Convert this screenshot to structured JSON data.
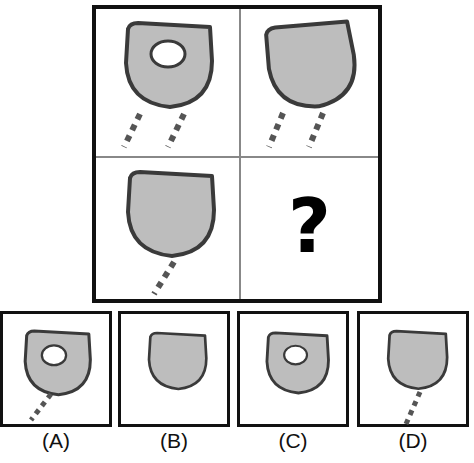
{
  "puzzle": {
    "type": "visual-analogy-matrix",
    "rows": 2,
    "cols": 2,
    "missing_cell": "bottom-right",
    "missing_marker": "?",
    "colors": {
      "shape_fill": "#bdbdbd",
      "shape_stroke": "#3a3a3a",
      "hole_fill": "#ffffff",
      "frame": "#111111",
      "divider": "#888888",
      "dash": "#555555"
    },
    "cells": [
      {
        "id": "cell-1",
        "position": "top-left",
        "shape": "half-moon-d",
        "has_hole": true,
        "rotation_deg": 0,
        "tail_count": 2,
        "tails": [
          "down-left",
          "down-right"
        ]
      },
      {
        "id": "cell-2",
        "position": "top-right",
        "shape": "half-moon-d",
        "has_hole": false,
        "rotation_deg": -8,
        "tail_count": 2,
        "tails": [
          "down-left",
          "down-right"
        ]
      },
      {
        "id": "cell-3",
        "position": "bottom-left",
        "shape": "half-moon-d",
        "has_hole": false,
        "rotation_deg": 0,
        "tail_count": 1,
        "tails": [
          "down-left"
        ]
      },
      {
        "id": "cell-4",
        "position": "bottom-right",
        "shape": "question-mark",
        "has_hole": false,
        "rotation_deg": 0,
        "tail_count": 0,
        "tails": []
      }
    ]
  },
  "options": [
    {
      "id": "option-a",
      "label": "(A)",
      "letter": "A",
      "shape": "half-moon-d",
      "has_hole": true,
      "tail_count": 1,
      "tails": [
        "down-left"
      ]
    },
    {
      "id": "option-b",
      "label": "(B)",
      "letter": "B",
      "shape": "half-moon-d",
      "has_hole": false,
      "tail_count": 0,
      "tails": []
    },
    {
      "id": "option-c",
      "label": "(C)",
      "letter": "C",
      "shape": "half-moon-d",
      "has_hole": true,
      "tail_count": 0,
      "tails": []
    },
    {
      "id": "option-d",
      "label": "(D)",
      "letter": "D",
      "shape": "half-moon-d",
      "has_hole": false,
      "tail_count": 1,
      "tails": [
        "down-right"
      ]
    }
  ]
}
